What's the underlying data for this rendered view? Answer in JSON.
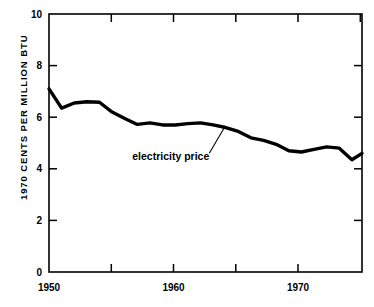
{
  "chart_data": {
    "type": "line",
    "title": "",
    "subtitle": "",
    "xlabel": "",
    "ylabel": "1970 CENTS PER MILLION BTU",
    "xlim": [
      1950,
      1974.8
    ],
    "ylim": [
      0,
      10
    ],
    "grid": false,
    "legend_position": "none",
    "x_ticks_major": [
      1950,
      1960,
      1970
    ],
    "x_tick_labels": [
      "1950",
      "1960",
      "1970"
    ],
    "x_ticks_minor": [
      1955,
      1965,
      1975
    ],
    "y_ticks": [
      0,
      2,
      4,
      6,
      8,
      10
    ],
    "y_tick_labels": [
      "0",
      "2",
      "4",
      "6",
      "8",
      "10"
    ],
    "annotations": [
      {
        "text": "electricity price",
        "text_x": 1962.7,
        "text_y": 4.35,
        "leader_from_x": 1962.7,
        "leader_from_y": 4.6,
        "leader_to_x": 1963.9,
        "leader_to_y": 5.6
      }
    ],
    "series": [
      {
        "name": "electricity price",
        "color": "#000000",
        "x": [
          1950,
          1951,
          1952,
          1953,
          1954,
          1955,
          1956,
          1957,
          1958,
          1959,
          1960,
          1961,
          1962,
          1963,
          1964,
          1965,
          1966,
          1967,
          1968,
          1969,
          1970,
          1971,
          1972,
          1973,
          1974,
          1974.8
        ],
        "values": [
          7.1,
          6.35,
          6.55,
          6.6,
          6.58,
          6.2,
          5.95,
          5.72,
          5.78,
          5.7,
          5.7,
          5.75,
          5.78,
          5.7,
          5.6,
          5.45,
          5.2,
          5.1,
          4.95,
          4.7,
          4.65,
          4.75,
          4.85,
          4.8,
          4.35,
          4.6
        ]
      }
    ]
  },
  "axis": {
    "y_title": "1970 CENTS PER MILLION BTU"
  },
  "annotation": {
    "label": "electricity price"
  }
}
